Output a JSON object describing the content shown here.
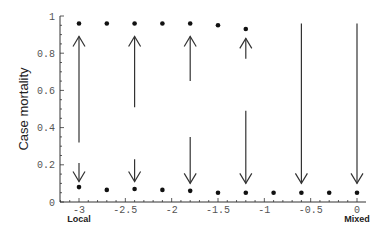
{
  "chart_data": {
    "type": "scatter",
    "title": "",
    "xlabel": "",
    "ylabel": "Case mortality",
    "xlim": [
      -3,
      0
    ],
    "ylim": [
      0,
      1
    ],
    "x_ticks": [
      -3,
      -2.5,
      -2,
      -1.5,
      -1,
      -0.5,
      0
    ],
    "x_tick_labels": [
      "-3",
      "-2.5",
      "-2",
      "-1.5",
      "-1",
      "-0.5",
      "0"
    ],
    "y_ticks": [
      0,
      0.2,
      0.4,
      0.6,
      0.8,
      1
    ],
    "y_tick_labels": [
      "0",
      "0.2",
      "0.4",
      "0.6",
      "0.8",
      "1"
    ],
    "x_end_labels": {
      "left": "Local",
      "right": "Mixed"
    },
    "grid": false,
    "legend": null,
    "series": [
      {
        "name": "upper equilibrium",
        "x": [
          -3,
          -2.7,
          -2.4,
          -2.1,
          -1.8,
          -1.5,
          -1.2
        ],
        "y": [
          0.96,
          0.96,
          0.96,
          0.96,
          0.96,
          0.95,
          0.93
        ]
      },
      {
        "name": "lower equilibrium",
        "x": [
          -3,
          -2.7,
          -2.4,
          -2.1,
          -1.8,
          -1.5,
          -1.2,
          -0.9,
          -0.6,
          -0.3,
          0
        ],
        "y": [
          0.08,
          0.065,
          0.07,
          0.065,
          0.06,
          0.05,
          0.05,
          0.05,
          0.05,
          0.05,
          0.05
        ]
      }
    ],
    "annotations": {
      "arrows": [
        {
          "x": -3,
          "from": 0.32,
          "to": 0.89,
          "direction": "up"
        },
        {
          "x": -3,
          "from": 0.21,
          "to": 0.11,
          "direction": "down"
        },
        {
          "x": -2.4,
          "from": 0.51,
          "to": 0.89,
          "direction": "up"
        },
        {
          "x": -2.4,
          "from": 0.23,
          "to": 0.11,
          "direction": "down"
        },
        {
          "x": -1.8,
          "from": 0.65,
          "to": 0.89,
          "direction": "up"
        },
        {
          "x": -1.8,
          "from": 0.35,
          "to": 0.1,
          "direction": "down"
        },
        {
          "x": -1.2,
          "from": 0.77,
          "to": 0.88,
          "direction": "up"
        },
        {
          "x": -1.2,
          "from": 0.49,
          "to": 0.1,
          "direction": "down"
        },
        {
          "x": -0.6,
          "from": 0.96,
          "to": 0.1,
          "direction": "down"
        },
        {
          "x": 0,
          "from": 0.96,
          "to": 0.1,
          "direction": "down"
        }
      ]
    }
  },
  "colors": {
    "axis": "#333333",
    "points": "#111111",
    "arrows": "#333333"
  }
}
